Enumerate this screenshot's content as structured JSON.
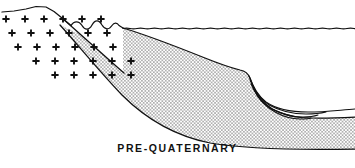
{
  "figure": {
    "caption": "PRE-QUATERNARY",
    "background_color": "#ffffff",
    "line_color": "#111111",
    "stipple_color": "#333333",
    "width": 355,
    "height": 168
  },
  "units": [
    {
      "id": "basement",
      "label": "crystalline basement",
      "pattern": "plus-symbols",
      "symbol": "+",
      "symbol_color": "#111111",
      "rows": [
        {
          "y": 19,
          "x_start": 6,
          "count": 6,
          "spacing": 19
        },
        {
          "y": 33,
          "x_start": 12,
          "count": 6,
          "spacing": 19
        },
        {
          "y": 47,
          "x_start": 18,
          "count": 6,
          "spacing": 19
        },
        {
          "y": 61,
          "x_start": 36,
          "count": 6,
          "spacing": 19
        },
        {
          "y": 75,
          "x_start": 55,
          "count": 5,
          "spacing": 19
        }
      ]
    },
    {
      "id": "quaternary-fill",
      "label": "quaternary stippled deposits",
      "pattern": "stipple-dots",
      "dot_spacing": 3.4,
      "dot_radius": 0.62
    }
  ],
  "lines": {
    "ground_surface": {
      "name": "ground-surface-profile",
      "path": "M 2,12 L 14,11 L 26,9 L 36,6.5 L 46,7 L 54,11.5 L 62,18 L 68,23 L 71,25.5"
    },
    "hummocky_crest": {
      "name": "hummocky-crest-line",
      "path": "M 71,25.5 C 74,20.5 79,20.5 82,25.5 C 85,30.5 89,30.5 92,25 C 95,19.5 99,19.5 102,25 C 105,30 109,30 112,25.5 C 114,22.5 117,22 119,25.5 L 123,28"
    },
    "water_surface": {
      "name": "water-surface-line",
      "wavy": true,
      "y": 28.5,
      "x_start": 123,
      "x_end": 355,
      "amplitude": 0.9,
      "wavelength": 7
    },
    "basement_contact": {
      "name": "basement-stipple-contact",
      "path": "M 62,18 L 80,34 L 98,50 L 116,66 L 124,73"
    },
    "deposit_top": {
      "name": "deposit-top-surface",
      "path": "M 123,28 C 150,36 180,48 205,58 C 220,64 232,68 240,70 C 245,71 248,73 250,78 C 253,86 256,94 261,100 C 268,108 280,114 296,117 C 312,119 334,118 355,117"
    },
    "deposit_base": {
      "name": "deposit-base-contact",
      "path": "M 60,25 C 78,45 100,72 122,95 C 145,118 175,136 210,143 C 245,149 300,150 355,149"
    },
    "wedge_beds": [
      {
        "name": "wedge-bed-1",
        "path": "M 249,76 C 253,87 258,96 266,102 C 276,109 292,112 308,112 C 325,112 340,110 355,109"
      },
      {
        "name": "wedge-bed-2",
        "path": "M 250,80 C 254,90 260,99 269,105 C 280,111 294,114 306,114 C 316,114 322,113 326,112"
      },
      {
        "name": "wedge-bed-3",
        "path": "M 251,84 C 256,95 263,103 272,109 C 282,114 294,117 303,117 C 310,117 315,116 318,115"
      },
      {
        "name": "wedge-bed-4",
        "path": "M 253,88 C 258,99 266,107 275,112 C 284,117 294,119 300,119 C 305,119 309,119 311,118"
      }
    ]
  }
}
